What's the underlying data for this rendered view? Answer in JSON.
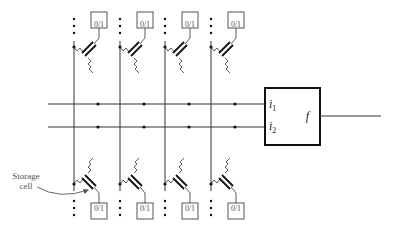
{
  "diagram": {
    "cell_value_label": "0/1",
    "columns": 4,
    "rows_top": 1,
    "rows_bottom": 1,
    "inputs": [
      {
        "name": "i",
        "sub": "1"
      },
      {
        "name": "i",
        "sub": "2"
      }
    ],
    "output": "f",
    "annotation": {
      "line1": "Storage",
      "line2": "cell"
    },
    "colors": {
      "line": "#333333",
      "box_border": "#111111",
      "label": "#555555"
    }
  }
}
